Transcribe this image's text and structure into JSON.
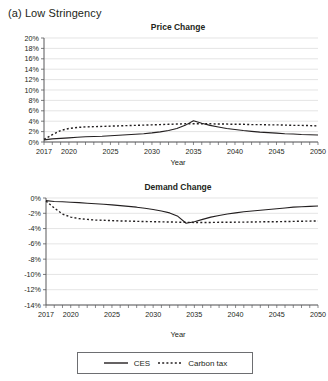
{
  "panel": {
    "label": "(a) Low Stringency"
  },
  "axis": {
    "xlabel": "Year"
  },
  "legend": {
    "items": [
      {
        "name": "CES",
        "style": "solid"
      },
      {
        "name": "Carbon tax",
        "style": "dotted"
      }
    ]
  },
  "chart_data": [
    {
      "type": "line",
      "title": "Price Change",
      "xlabel": "Year",
      "ylabel": "",
      "xlim": [
        2017,
        2050
      ],
      "ylim": [
        0,
        20
      ],
      "grid": true,
      "legend_position": "bottom",
      "xticks": [
        2017,
        2020,
        2025,
        2030,
        2035,
        2040,
        2045,
        2050
      ],
      "xtick_labels": [
        "2017",
        "2020",
        "2025",
        "2030",
        "2035",
        "2040",
        "2045",
        "2050"
      ],
      "yticks": [
        0,
        2,
        4,
        6,
        8,
        10,
        12,
        14,
        16,
        18,
        20
      ],
      "ytick_labels": [
        "0%",
        "2%",
        "4%",
        "6%",
        "8%",
        "10%",
        "12%",
        "14%",
        "16%",
        "18%",
        "20%"
      ],
      "x": [
        2017,
        2018,
        2019,
        2020,
        2021,
        2022,
        2023,
        2024,
        2025,
        2026,
        2027,
        2028,
        2029,
        2030,
        2031,
        2032,
        2033,
        2034,
        2035,
        2036,
        2037,
        2038,
        2039,
        2040,
        2041,
        2042,
        2043,
        2044,
        2045,
        2046,
        2047,
        2048,
        2049,
        2050
      ],
      "series": [
        {
          "name": "CES",
          "style": "solid",
          "values": [
            0.4,
            0.6,
            0.7,
            0.8,
            0.9,
            1.0,
            1.05,
            1.1,
            1.2,
            1.3,
            1.4,
            1.5,
            1.6,
            1.75,
            1.95,
            2.2,
            2.6,
            3.2,
            4.1,
            3.6,
            3.2,
            2.9,
            2.6,
            2.4,
            2.2,
            2.05,
            1.9,
            1.8,
            1.7,
            1.6,
            1.55,
            1.45,
            1.4,
            1.35
          ]
        },
        {
          "name": "Carbon tax",
          "style": "dotted",
          "values": [
            0.5,
            1.4,
            2.2,
            2.6,
            2.8,
            2.9,
            2.95,
            3.0,
            3.05,
            3.1,
            3.15,
            3.2,
            3.25,
            3.3,
            3.35,
            3.4,
            3.45,
            3.5,
            3.5,
            3.5,
            3.5,
            3.45,
            3.45,
            3.4,
            3.4,
            3.35,
            3.35,
            3.3,
            3.3,
            3.25,
            3.2,
            3.2,
            3.15,
            3.1
          ]
        }
      ]
    },
    {
      "type": "line",
      "title": "Demand Change",
      "xlabel": "Year",
      "ylabel": "",
      "xlim": [
        2017,
        2050
      ],
      "ylim": [
        -14,
        0
      ],
      "grid": true,
      "legend_position": "bottom",
      "xticks": [
        2017,
        2020,
        2025,
        2030,
        2035,
        2040,
        2045,
        2050
      ],
      "xtick_labels": [
        "2017",
        "2020",
        "2025",
        "2030",
        "2035",
        "2040",
        "2045",
        "2050"
      ],
      "yticks": [
        0,
        -2,
        -4,
        -6,
        -8,
        -10,
        -12,
        -14
      ],
      "ytick_labels": [
        "0%",
        "-2%",
        "-4%",
        "-6%",
        "-8%",
        "-10%",
        "-12%",
        "-14%"
      ],
      "x": [
        2017,
        2018,
        2019,
        2020,
        2021,
        2022,
        2023,
        2024,
        2025,
        2026,
        2027,
        2028,
        2029,
        2030,
        2031,
        2032,
        2033,
        2034,
        2035,
        2036,
        2037,
        2038,
        2039,
        2040,
        2041,
        2042,
        2043,
        2044,
        2045,
        2046,
        2047,
        2048,
        2049,
        2050
      ],
      "series": [
        {
          "name": "CES",
          "style": "solid",
          "values": [
            -0.35,
            -0.45,
            -0.5,
            -0.55,
            -0.6,
            -0.68,
            -0.75,
            -0.82,
            -0.9,
            -1.0,
            -1.1,
            -1.2,
            -1.35,
            -1.5,
            -1.7,
            -1.95,
            -2.4,
            -3.3,
            -3.1,
            -2.8,
            -2.5,
            -2.3,
            -2.1,
            -1.95,
            -1.8,
            -1.7,
            -1.6,
            -1.5,
            -1.4,
            -1.3,
            -1.2,
            -1.15,
            -1.1,
            -1.05
          ]
        },
        {
          "name": "Carbon tax",
          "style": "dotted",
          "values": [
            -0.4,
            -1.3,
            -2.1,
            -2.5,
            -2.7,
            -2.8,
            -2.88,
            -2.92,
            -2.96,
            -3.0,
            -3.02,
            -3.05,
            -3.08,
            -3.1,
            -3.12,
            -3.14,
            -3.16,
            -3.18,
            -3.2,
            -3.2,
            -3.2,
            -3.18,
            -3.18,
            -3.16,
            -3.16,
            -3.14,
            -3.12,
            -3.1,
            -3.1,
            -3.08,
            -3.06,
            -3.04,
            -3.02,
            -3.0
          ]
        }
      ]
    }
  ]
}
